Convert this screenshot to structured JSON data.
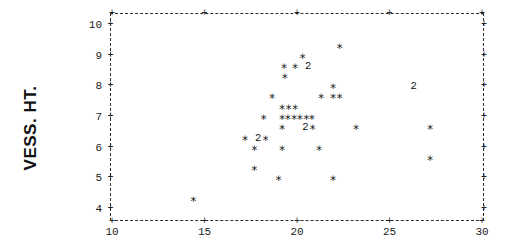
{
  "figure": {
    "background": "#ffffff",
    "ink_color": "#1b1b1b"
  },
  "chart_data": {
    "type": "scatter",
    "title": "",
    "xlabel": "",
    "ylabel": "VESS. HT.",
    "marker_glyph": "*",
    "overlap_digit_shown": "2",
    "xlim": [
      10,
      30
    ],
    "ylim": [
      4,
      10
    ],
    "x_ticks": [
      10,
      15,
      20,
      25,
      30
    ],
    "y_ticks": [
      10,
      9,
      8,
      7,
      6,
      5,
      4
    ],
    "grid": false,
    "frame_style": "dashed",
    "points": [
      {
        "x": 22.3,
        "y": 9.33,
        "count": 1
      },
      {
        "x": 20.3,
        "y": 9.0,
        "count": 1
      },
      {
        "x": 19.3,
        "y": 8.67,
        "count": 1
      },
      {
        "x": 19.9,
        "y": 8.67,
        "count": 1
      },
      {
        "x": 20.6,
        "y": 8.67,
        "count": 2
      },
      {
        "x": 19.35,
        "y": 8.33,
        "count": 1
      },
      {
        "x": 21.95,
        "y": 8.0,
        "count": 1
      },
      {
        "x": 26.3,
        "y": 8.0,
        "count": 2
      },
      {
        "x": 18.65,
        "y": 7.67,
        "count": 1
      },
      {
        "x": 21.3,
        "y": 7.67,
        "count": 1
      },
      {
        "x": 21.95,
        "y": 7.67,
        "count": 1
      },
      {
        "x": 22.3,
        "y": 7.67,
        "count": 1
      },
      {
        "x": 19.2,
        "y": 7.33,
        "count": 1
      },
      {
        "x": 19.55,
        "y": 7.33,
        "count": 1
      },
      {
        "x": 19.9,
        "y": 7.33,
        "count": 1
      },
      {
        "x": 18.2,
        "y": 7.0,
        "count": 1
      },
      {
        "x": 19.2,
        "y": 7.0,
        "count": 1
      },
      {
        "x": 19.5,
        "y": 7.0,
        "count": 1
      },
      {
        "x": 19.85,
        "y": 7.0,
        "count": 1
      },
      {
        "x": 20.15,
        "y": 7.0,
        "count": 1
      },
      {
        "x": 20.5,
        "y": 7.0,
        "count": 1
      },
      {
        "x": 20.8,
        "y": 7.0,
        "count": 1
      },
      {
        "x": 19.2,
        "y": 6.67,
        "count": 1
      },
      {
        "x": 20.45,
        "y": 6.67,
        "count": 2
      },
      {
        "x": 20.85,
        "y": 6.67,
        "count": 1
      },
      {
        "x": 23.2,
        "y": 6.67,
        "count": 1
      },
      {
        "x": 27.2,
        "y": 6.67,
        "count": 1
      },
      {
        "x": 17.2,
        "y": 6.33,
        "count": 1
      },
      {
        "x": 17.9,
        "y": 6.33,
        "count": 2
      },
      {
        "x": 18.3,
        "y": 6.33,
        "count": 1
      },
      {
        "x": 17.7,
        "y": 6.0,
        "count": 1
      },
      {
        "x": 19.2,
        "y": 6.0,
        "count": 1
      },
      {
        "x": 21.2,
        "y": 6.0,
        "count": 1
      },
      {
        "x": 27.2,
        "y": 5.67,
        "count": 1
      },
      {
        "x": 17.7,
        "y": 5.33,
        "count": 1
      },
      {
        "x": 19.0,
        "y": 5.0,
        "count": 1
      },
      {
        "x": 21.95,
        "y": 5.0,
        "count": 1
      },
      {
        "x": 14.4,
        "y": 4.33,
        "count": 1
      }
    ]
  }
}
